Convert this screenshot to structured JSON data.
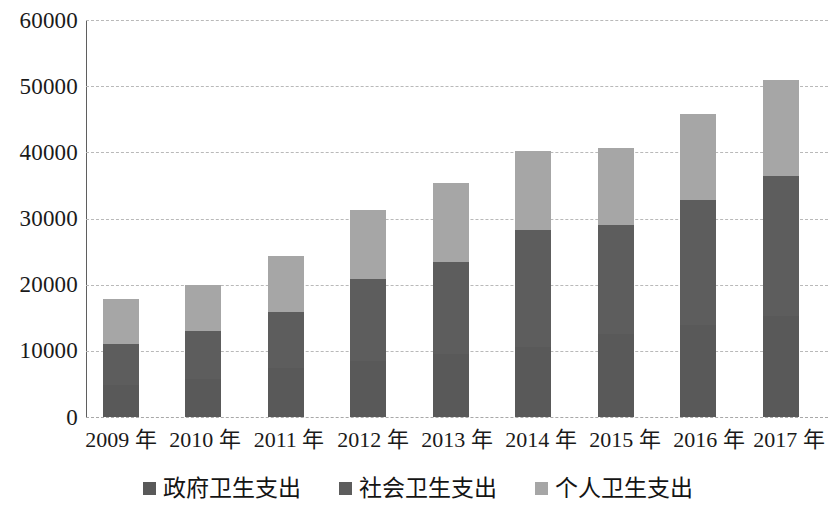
{
  "chart_data": {
    "type": "bar",
    "stacked": true,
    "title": "",
    "subtitle": "",
    "xlabel": "",
    "ylabel": "",
    "categories": [
      "2009 年",
      "2010 年",
      "2011 年",
      "2012 年",
      "2013 年",
      "2014 年",
      "2015 年",
      "2016 年",
      "2017 年"
    ],
    "series": [
      {
        "name": "政府卫生支出",
        "color": "#595959",
        "values": [
          4816,
          5732,
          7464,
          8432,
          9546,
          10579,
          12475,
          13910,
          15206
        ]
      },
      {
        "name": "社会卫生支出",
        "color": "#5d5d5d",
        "values": [
          6154,
          7196,
          8416,
          12476,
          13861,
          17646,
          16507,
          18844,
          21206
        ]
      },
      {
        "name": "个人卫生支出",
        "color": "#a6a6a6",
        "values": [
          6830,
          7072,
          8420,
          10392,
          11893,
          11975,
          11618,
          13046,
          14588
        ]
      }
    ],
    "totals": [
      17800,
      20000,
      24300,
      31300,
      35300,
      40200,
      40600,
      45800,
      51000
    ],
    "ylim": [
      0,
      60000
    ],
    "yticks": [
      0,
      10000,
      20000,
      30000,
      40000,
      50000,
      60000
    ],
    "ytick_labels": [
      "0",
      "10000",
      "20000",
      "30000",
      "40000",
      "50000",
      "60000"
    ],
    "grid": true,
    "grid_style": "dashed",
    "grid_axis": "y",
    "legend_position": "bottom",
    "background": "#ffffff"
  },
  "axis": {
    "y_labels": [
      "60000",
      "50000",
      "40000",
      "30000",
      "20000",
      "10000",
      "0"
    ],
    "x_labels": [
      "2009 年",
      "2010 年",
      "2011 年",
      "2012 年",
      "2013 年",
      "2014 年",
      "2015 年",
      "2016 年",
      "2017 年"
    ]
  },
  "legend": {
    "items": [
      {
        "label": "政府卫生支出",
        "color": "#595959",
        "icon": "square-swatch-icon"
      },
      {
        "label": "社会卫生支出",
        "color": "#5d5d5d",
        "icon": "square-swatch-icon"
      },
      {
        "label": "个人卫生支出",
        "color": "#a6a6a6",
        "icon": "square-swatch-icon"
      }
    ]
  }
}
